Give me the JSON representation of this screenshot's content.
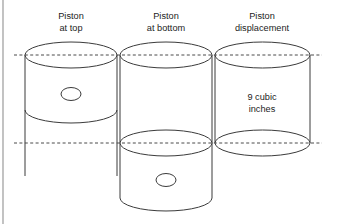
{
  "figure": {
    "title_hidden": "",
    "background_color": "#ffffff",
    "stroke_color": "#3b3b3b",
    "dash_color": "#4a4a4a",
    "frame_color": "#9a9a9a",
    "text_color": "#1c1c1c",
    "width": 337,
    "height": 224
  },
  "captions": [
    {
      "id": "piston-at-top",
      "line1": "Piston",
      "line2": "at top",
      "x": 71,
      "y1": 16,
      "y2": 28
    },
    {
      "id": "piston-at-bottom",
      "line1": "Piston",
      "line2": "at bottom",
      "x": 166,
      "y1": 16,
      "y2": 28
    },
    {
      "id": "piston-displacement",
      "line1": "Piston",
      "line2": "displacement",
      "x": 262,
      "y1": 16,
      "y2": 28
    }
  ],
  "inner_labels": [
    {
      "id": "displacement-volume",
      "line1": "9 cubic",
      "line2": "inches",
      "x": 262,
      "y1": 97,
      "y2": 109
    }
  ],
  "reference_lines": [
    {
      "id": "top-dead-center-line",
      "y": 55,
      "x1": 14,
      "x2": 322,
      "style": "dashed"
    },
    {
      "id": "bottom-dead-center-line",
      "y": 143,
      "x1": 14,
      "x2": 322,
      "style": "dashed"
    }
  ],
  "cylinders": [
    {
      "id": "cylinder-piston-at-top",
      "left": 25,
      "right": 117,
      "top_ellipse_cy": 55,
      "piston_bottom_cy": 110,
      "skirt_bottom_y": 176,
      "ry": 13,
      "pin_hole": {
        "cx": 71,
        "cy": 94,
        "rx": 10,
        "ry": 6.5
      }
    },
    {
      "id": "cylinder-piston-at-bottom",
      "left": 120,
      "right": 212,
      "top_ellipse_cy": 55,
      "piston_bottom_cy": 143,
      "skirt_bottom_y": 198,
      "ry": 13,
      "pin_hole": {
        "cx": 166,
        "cy": 180,
        "rx": 10,
        "ry": 6.5
      }
    },
    {
      "id": "cylinder-piston-displacement",
      "left": 215,
      "right": 310,
      "top_ellipse_cy": 55,
      "piston_bottom_cy": 143,
      "skirt_bottom_y": 143,
      "ry": 13,
      "pin_hole": null
    }
  ],
  "frame": {
    "left_border_x": 3,
    "left_border_y1": 0,
    "left_border_y2": 224
  }
}
